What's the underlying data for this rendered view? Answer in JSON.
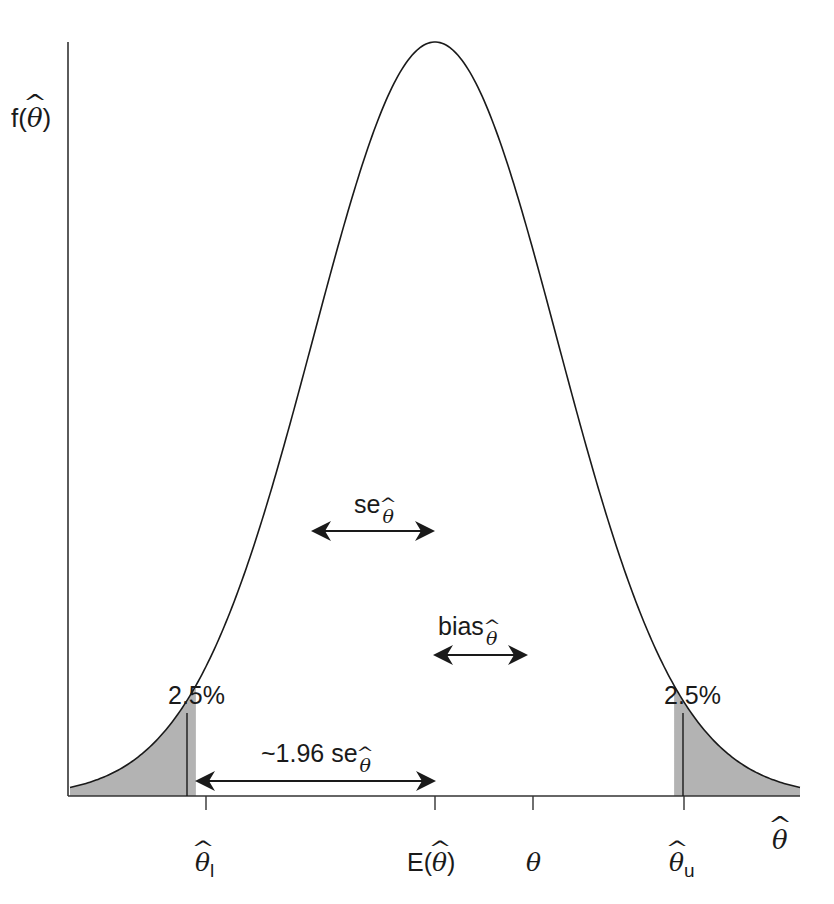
{
  "chart_data": {
    "type": "line",
    "title": "",
    "ylabel": "f(θ̂)",
    "xlabel": "θ̂",
    "grid": false,
    "legend": null,
    "distribution": {
      "family": "normal",
      "mean_label": "E(θ̂)",
      "mean_px": 435,
      "sd_px": 122,
      "peak_px_y": 42
    },
    "x_ticks": [
      {
        "label": "θ̂l",
        "px": 206
      },
      {
        "label": "E(θ̂)",
        "px": 435
      },
      {
        "label": "θ",
        "px": 533
      },
      {
        "label": "θ̂u",
        "px": 684
      }
    ],
    "annotations": [
      {
        "text": "se θ̂",
        "type": "double-arrow",
        "from_px": 313,
        "to_px": 435,
        "y_px": 531
      },
      {
        "text": "bias θ̂",
        "type": "double-arrow",
        "from_px": 435,
        "to_px": 527,
        "y_px": 655
      },
      {
        "text": "~1.96 se θ̂",
        "type": "double-arrow",
        "from_px": 196,
        "to_px": 435,
        "y_px": 781
      },
      {
        "text": "2.5%",
        "type": "tail-area",
        "side": "lower",
        "marker_px": 187
      },
      {
        "text": "2.5%",
        "type": "tail-area",
        "side": "upper",
        "marker_px": 682
      }
    ],
    "tail_probability": {
      "lower": 2.5,
      "upper": 2.5,
      "unit": "%"
    }
  },
  "labels": {
    "y_axis": {
      "prefix": "f(",
      "sym": "θ",
      "suffix": ")"
    },
    "x_axis": {
      "sym": "θ"
    },
    "tick_lower": {
      "sym": "θ",
      "sub": "l"
    },
    "tick_mean": {
      "prefix": "E(",
      "sym": "θ",
      "suffix": ")"
    },
    "tick_theta": {
      "sym": "θ"
    },
    "tick_upper": {
      "sym": "θ",
      "sub": "u"
    },
    "se": {
      "text": "se",
      "sub": "θ"
    },
    "bias": {
      "text": "bias",
      "sub": "θ"
    },
    "ci_half": {
      "text": "~1.96 se",
      "sub": "θ"
    },
    "tail_lower": "2.5%",
    "tail_upper": "2.5%"
  },
  "colors": {
    "line": "#1a1a1a",
    "tail_fill": "#b3b3b3",
    "background": "#ffffff"
  }
}
